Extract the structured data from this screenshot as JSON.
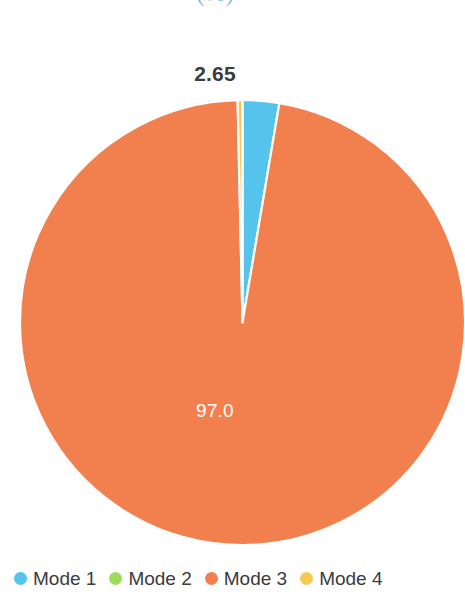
{
  "chart_data": {
    "type": "pie",
    "title": "",
    "subtitle": "(%)",
    "categories": [
      "Mode 1",
      "Mode 2",
      "Mode 3",
      "Mode 4"
    ],
    "values": [
      2.65,
      0,
      97.0,
      0.35
    ],
    "data_labels": [
      "2.65",
      "",
      "97.0",
      ""
    ],
    "colors": [
      "#56c3ec",
      "#9bdd5a",
      "#f2804f",
      "#f6c955"
    ],
    "legend_position": "bottom",
    "grid": false,
    "start_angle_deg": -90,
    "slice_separator_color": "#ffffff"
  },
  "header": {
    "title_cropped": "",
    "unit_label": "(%)",
    "title_color": "#8cbfe0"
  },
  "labels": {
    "outer_value": "2.65",
    "inner_value": "97.0",
    "outer_color": "#3b3b3b",
    "inner_color": "#ffffff"
  },
  "legend": {
    "items": [
      {
        "label": "Mode 1",
        "color": "#56c3ec"
      },
      {
        "label": "Mode 2",
        "color": "#9bdd5a"
      },
      {
        "label": "Mode 3",
        "color": "#f2804f"
      },
      {
        "label": "Mode 4",
        "color": "#f6c955"
      }
    ]
  },
  "palette": {
    "background": "#ffffff",
    "text": "#3b3b3b",
    "accent_blue": "#56c3ec",
    "accent_orange": "#f2804f"
  }
}
